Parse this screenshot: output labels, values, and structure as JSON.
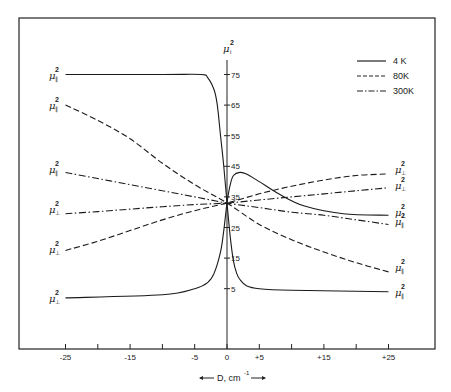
{
  "chart_data": {
    "type": "line",
    "title": "",
    "xlabel": "D, cm⁻¹",
    "ylabel": "μi²",
    "xlim": [
      -30,
      33
    ],
    "ylim": [
      -15,
      90
    ],
    "x_ticks": [
      -25,
      -20,
      -15,
      -10,
      -5,
      0,
      5,
      10,
      15,
      20,
      25
    ],
    "x_tick_labels": [
      "-25",
      "",
      "-15",
      "",
      "-5",
      "0",
      "+5",
      "",
      "+15",
      "",
      "+25"
    ],
    "y_ticks": [
      75,
      65,
      55,
      45,
      35,
      25,
      15,
      5
    ],
    "y_tick_labels": [
      "75",
      "65",
      "55",
      "45",
      "35",
      "25",
      "15",
      "5"
    ],
    "grid": false,
    "legend_position": "upper right",
    "legend": [
      {
        "label": "4 K",
        "style": "solid"
      },
      {
        "label": "80K",
        "style": "dashed"
      },
      {
        "label": "300K",
        "style": "dashdot"
      }
    ],
    "series": [
      {
        "name": "4K μ∥²",
        "style": "solid",
        "end_label_left": "μ∥²",
        "end_label_right": "μ∥²",
        "x": [
          -25,
          -10,
          -4,
          -3,
          -2,
          -1.5,
          -1,
          -0.5,
          0,
          0.5,
          1,
          1.5,
          2,
          3,
          5,
          10,
          25
        ],
        "y": [
          75,
          75,
          75,
          74,
          70,
          65,
          55,
          45,
          33,
          22,
          14,
          10,
          8,
          6,
          5,
          4.5,
          4
        ]
      },
      {
        "name": "4K μ⊥²",
        "style": "solid",
        "end_label_left": "μ⊥²",
        "end_label_right": "μ⊥²",
        "x": [
          -25,
          -10,
          -5,
          -3,
          -2,
          -1,
          -0.5,
          0,
          0.5,
          1,
          2,
          3,
          5,
          8,
          12,
          18,
          25
        ],
        "y": [
          2,
          3,
          5,
          7,
          10,
          17,
          24,
          33,
          39,
          42,
          43,
          42.5,
          40,
          36,
          32,
          29.5,
          29
        ]
      },
      {
        "name": "80K μ∥²",
        "style": "dashed",
        "end_label_left": "μ∥²",
        "end_label_right": "μ∥²",
        "x": [
          -25,
          -20,
          -15,
          -10,
          -5,
          0,
          5,
          10,
          15,
          20,
          25
        ],
        "y": [
          65,
          60,
          54,
          46,
          39,
          33,
          26,
          21,
          17,
          13.5,
          10.5
        ]
      },
      {
        "name": "80K μ⊥²",
        "style": "dashed",
        "end_label_left": "μ⊥²",
        "end_label_right": "μ⊥²",
        "x": [
          -25,
          -20,
          -15,
          -10,
          -5,
          0,
          5,
          10,
          15,
          20,
          25
        ],
        "y": [
          17.5,
          20.5,
          24,
          27.5,
          30.5,
          33,
          36,
          38.5,
          40.5,
          42,
          42.5
        ]
      },
      {
        "name": "300K μ∥²",
        "style": "dashdot",
        "end_label_left": "μ∥²",
        "end_label_right": "μ∥²",
        "x": [
          -25,
          -20,
          -15,
          -10,
          -5,
          0,
          5,
          10,
          15,
          20,
          25
        ],
        "y": [
          43,
          41,
          39,
          37,
          35,
          33,
          31.5,
          30,
          29,
          27.5,
          26
        ]
      },
      {
        "name": "300K μ⊥²",
        "style": "dashdot",
        "end_label_left": "μ⊥²",
        "end_label_right": "μ⊥²",
        "x": [
          -25,
          -20,
          -15,
          -10,
          -5,
          0,
          5,
          10,
          15,
          20,
          25
        ],
        "y": [
          29.5,
          30.2,
          31,
          31.8,
          32.5,
          33,
          34,
          35,
          36,
          37,
          38
        ]
      }
    ]
  },
  "axis": {
    "y_title": "μ",
    "y_title_sup": "2",
    "y_title_sub": "i",
    "x_title": "D, cm",
    "x_title_sup": "-1"
  },
  "legend": {
    "items": [
      {
        "label": "4 K"
      },
      {
        "label": "80K"
      },
      {
        "label": "300K"
      }
    ]
  },
  "curve_labels": {
    "left": [
      {
        "mu": "μ",
        "sup": "2",
        "sub": "∥"
      },
      {
        "mu": "μ",
        "sup": "2",
        "sub": "∥"
      },
      {
        "mu": "μ",
        "sup": "2",
        "sub": "∥"
      },
      {
        "mu": "μ",
        "sup": "2",
        "sub": "⊥"
      },
      {
        "mu": "μ",
        "sup": "2",
        "sub": "⊥"
      },
      {
        "mu": "μ",
        "sup": "2",
        "sub": "⊥"
      }
    ],
    "right": [
      {
        "mu": "μ",
        "sup": "2",
        "sub": "⊥"
      },
      {
        "mu": "μ",
        "sup": "2",
        "sub": "⊥"
      },
      {
        "mu": "μ",
        "sup": "2",
        "sub": "⊥"
      },
      {
        "mu": "μ",
        "sup": "2",
        "sub": "∥"
      },
      {
        "mu": "μ",
        "sup": "2",
        "sub": "∥"
      },
      {
        "mu": "μ",
        "sup": "2",
        "sub": "∥"
      }
    ]
  }
}
